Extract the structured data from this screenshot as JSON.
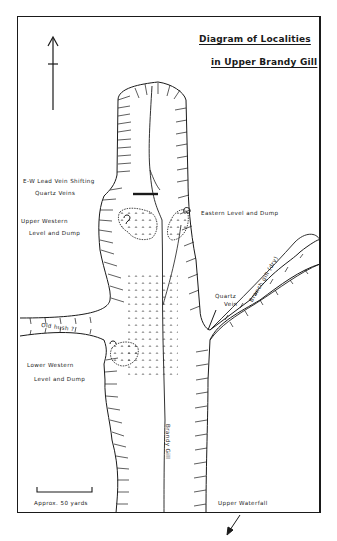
{
  "diagram": {
    "title_line1": "Diagram of Localities",
    "title_line2": "in Upper Brandy Gill",
    "north_arrow": "north-arrow-icon",
    "labels": {
      "ew_lead_vein": "E-W Lead Vein Shifting",
      "quartz_veins": "Quartz Veins",
      "upper_western_1": "Upper Western",
      "upper_western_2": "Level and Dump",
      "eastern_level": "Eastern Level and Dump",
      "quartz_vein_1": "Quartz",
      "quartz_vein_2": "Vein",
      "branch_gill": "Branch gill (dry)",
      "old_hush": "Old hush ?",
      "lower_western_1": "Lower Western",
      "lower_western_2": "Level and Dump",
      "brandy_gill": "Brandy Gill",
      "scale": "Approx. 50 yards",
      "upper_waterfall": "Upper Waterfall"
    },
    "colors": {
      "ink": "#1a1a1a",
      "paper": "#ffffff"
    }
  }
}
